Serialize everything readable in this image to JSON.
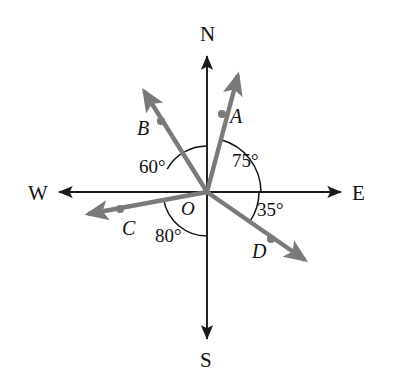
{
  "figure": {
    "background_color": "#ffffff",
    "axis_color": "#1a1a1a",
    "ray_color": "#7a7a7a",
    "arc_color": "#111111",
    "label_color": "#111111"
  },
  "origin": {
    "label": "O",
    "x": 207,
    "y": 192
  },
  "compass": [
    {
      "name": "north",
      "label": "N",
      "x": 200,
      "y": 24,
      "tip_x": 207,
      "tip_y": 55
    },
    {
      "name": "south",
      "label": "S",
      "x": 200,
      "y": 350,
      "tip_x": 207,
      "tip_y": 340
    },
    {
      "name": "east",
      "label": "E",
      "x": 352,
      "y": 183,
      "tip_x": 342,
      "tip_y": 192
    },
    {
      "name": "west",
      "label": "W",
      "x": 28,
      "y": 183,
      "tip_x": 58,
      "tip_y": 192
    }
  ],
  "rays": [
    {
      "id": "A",
      "label": "A",
      "label_x": 230,
      "label_y": 106,
      "bearing_from_east_deg": 75,
      "tip_x": 238,
      "tip_y": 75,
      "dot_x": 222,
      "dot_y": 114
    },
    {
      "id": "B",
      "label": "B",
      "label_x": 137,
      "label_y": 118,
      "bearing_from_east_deg": 150,
      "tip_x": 144,
      "tip_y": 91,
      "dot_x": 161,
      "dot_y": 121
    },
    {
      "id": "C",
      "label": "C",
      "label_x": 122,
      "label_y": 218,
      "bearing_from_east_deg": 190,
      "tip_x": 88,
      "tip_y": 214,
      "dot_x": 120,
      "dot_y": 209
    },
    {
      "id": "D",
      "label": "D",
      "label_x": 252,
      "label_y": 241,
      "bearing_from_east_deg": -35,
      "tip_x": 305,
      "tip_y": 260,
      "dot_x": 271,
      "dot_y": 239
    }
  ],
  "angles": [
    {
      "id": "angle-75",
      "label": "75°",
      "value": 75,
      "from": "E",
      "to": "A",
      "start_deg": 0,
      "end_deg": 75,
      "radius": 54,
      "label_x": 232,
      "label_y": 151
    },
    {
      "id": "angle-60",
      "label": "60°",
      "value": 60,
      "from": "B",
      "to": "N",
      "start_deg": 90,
      "end_deg": 150,
      "radius": 46,
      "label_x": 139,
      "label_y": 157
    },
    {
      "id": "angle-80",
      "label": "80°",
      "value": 80,
      "from": "C",
      "to": "S",
      "start_deg": 190,
      "end_deg": 270,
      "radius": 44,
      "label_x": 155,
      "label_y": 226
    },
    {
      "id": "angle-35",
      "label": "35°",
      "value": 35,
      "from": "E",
      "to": "D",
      "start_deg": -35,
      "end_deg": 0,
      "radius": 52,
      "label_x": 257,
      "label_y": 200
    }
  ]
}
